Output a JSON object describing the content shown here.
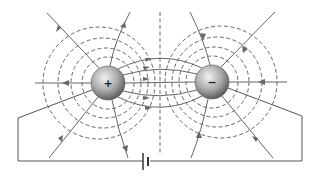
{
  "diagram": {
    "type": "electric-dipole-field-lines",
    "positive_charge": {
      "label": "+",
      "cx": 108,
      "cy": 83,
      "r": 17
    },
    "negative_charge": {
      "label": "−",
      "cx": 212,
      "cy": 82,
      "r": 17
    },
    "battery": {
      "x": 150,
      "y": 161
    },
    "colors": {
      "sphere_light": "#e8e8e8",
      "sphere_dark": "#6e6e6e",
      "lines": "#666666",
      "equipotential": "#555555"
    }
  }
}
